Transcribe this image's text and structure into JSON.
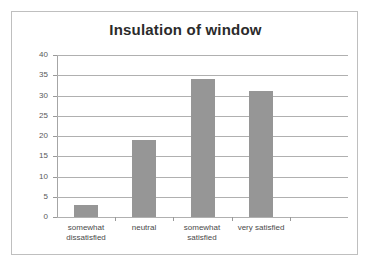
{
  "chart_data": {
    "type": "bar",
    "title": "Insulation of window",
    "xlabel": "",
    "ylabel": "",
    "categories": [
      "somewhat dissatisfied",
      "neutral",
      "somewhat satisfied",
      "very satisfied"
    ],
    "values": [
      3,
      19,
      34,
      31
    ],
    "ylim": [
      0,
      40
    ],
    "ytick_step": 5,
    "ytick_labels": [
      "0",
      "5",
      "10",
      "15",
      "20",
      "25",
      "30",
      "35",
      "40"
    ],
    "grid": true,
    "legend": false,
    "bar_color": "#969696",
    "gridline_color": "#b0b0b0",
    "axis_color": "#9a9a9a",
    "title_color": "#2b2b2b",
    "tick_label_color": "#595959",
    "category_label_color": "#4a4a4a",
    "frame_color": "#bfbfbf",
    "background_color": "#ffffff",
    "empty_trailing_slot": true
  },
  "category_lines": [
    [
      "somewhat",
      "dissatisfied"
    ],
    [
      "neutral",
      ""
    ],
    [
      "somewhat",
      "satisfied"
    ],
    [
      "very satisfied",
      ""
    ]
  ]
}
